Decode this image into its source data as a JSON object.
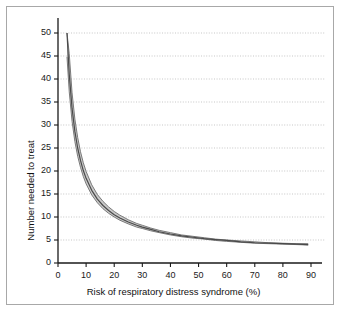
{
  "figure": {
    "background": "#ffffff",
    "frame_color": "#a8a8a8"
  },
  "chart_data": {
    "type": "line",
    "title": "",
    "subtitle": "",
    "xlabel": "Risk of respiratory distress syndrome (%)",
    "ylabel": "Number needed to treat",
    "xlim": [
      0,
      95
    ],
    "ylim": [
      0,
      53
    ],
    "xticks": [
      0,
      10,
      20,
      30,
      40,
      50,
      60,
      70,
      80,
      90
    ],
    "yticks": [
      0,
      5,
      10,
      15,
      20,
      25,
      30,
      35,
      40,
      45,
      50
    ],
    "xtick_labels": [
      "0",
      "10",
      "20",
      "30",
      "40",
      "50",
      "60",
      "70",
      "80",
      "90"
    ],
    "ytick_labels": [
      "0",
      "5",
      "10",
      "15",
      "20",
      "25",
      "30",
      "35",
      "40",
      "45",
      "50"
    ],
    "grid": "horizontal-dotted",
    "grid_color": "#b9b9b9",
    "legend": "none",
    "band_fill_color": "#c6c6c6",
    "band_edge_color": "#6e6e6e",
    "center_line_color": "#4a4a4a",
    "annotation": "Number needed to treat falls hyperbolically as baseline risk of respiratory distress syndrome rises; shaded area is the confidence band.",
    "x": [
      3.2,
      4,
      5,
      6,
      7,
      8,
      9,
      10,
      12,
      14,
      16,
      18,
      20,
      22,
      25,
      28,
      30,
      33,
      36,
      40,
      44,
      48,
      52,
      56,
      60,
      65,
      70,
      75,
      80,
      85,
      89
    ],
    "series": [
      {
        "name": "Upper confidence limit",
        "values": [
          56.2,
          45.5,
          37.0,
          31.3,
          27.3,
          24.2,
          21.8,
          19.9,
          17.0,
          14.9,
          13.4,
          12.2,
          11.2,
          10.4,
          9.4,
          8.6,
          8.2,
          7.6,
          7.1,
          6.6,
          6.1,
          5.8,
          5.5,
          5.2,
          5.0,
          4.8,
          4.6,
          4.4,
          4.3,
          4.2,
          4.2
        ]
      },
      {
        "name": "Point estimate",
        "values": [
          50.0,
          41.0,
          33.6,
          28.6,
          25.0,
          22.3,
          20.1,
          18.4,
          15.8,
          13.9,
          12.5,
          11.4,
          10.5,
          9.8,
          8.9,
          8.2,
          7.8,
          7.3,
          6.8,
          6.3,
          5.9,
          5.6,
          5.3,
          5.1,
          4.9,
          4.6,
          4.4,
          4.3,
          4.2,
          4.1,
          4.0
        ]
      },
      {
        "name": "Lower confidence limit",
        "values": [
          44.8,
          37.2,
          30.8,
          26.4,
          23.2,
          20.8,
          18.8,
          17.2,
          14.8,
          13.1,
          11.8,
          10.8,
          10.0,
          9.3,
          8.5,
          7.8,
          7.5,
          7.0,
          6.6,
          6.1,
          5.7,
          5.4,
          5.2,
          4.9,
          4.7,
          4.5,
          4.3,
          4.2,
          4.1,
          4.0,
          3.9
        ]
      }
    ]
  }
}
